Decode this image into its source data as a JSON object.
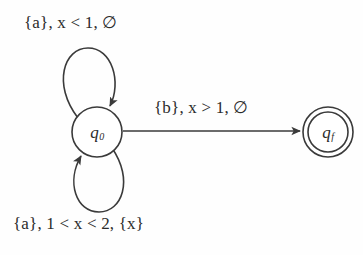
{
  "figure": {
    "kind": "timed-automaton-diagram",
    "background_color": "#fefefe",
    "stroke_color": "#3a3a3a",
    "text_color": "#2b2b2b"
  },
  "states": {
    "initial": {
      "id": "q0",
      "name": "q",
      "subscript": "0",
      "accepting": false,
      "center": {
        "x": 97,
        "y": 132
      },
      "radius": 25
    },
    "final": {
      "id": "qf",
      "name": "q",
      "subscript": "f",
      "accepting": true,
      "center": {
        "x": 328,
        "y": 132
      },
      "outer_radius": 25,
      "inner_radius": 20
    }
  },
  "transitions": {
    "self_loop_top": {
      "label": "{a}, x < 1, ∅",
      "action": "{a}",
      "guard": "x < 1",
      "reset": "∅",
      "from": "q0",
      "to": "q0"
    },
    "edge_to_final": {
      "label": "{b}, x > 1, ∅",
      "action": "{b}",
      "guard": "x > 1",
      "reset": "∅",
      "from": "q0",
      "to": "qf"
    },
    "self_loop_bottom": {
      "label": "{a}, 1 < x < 2, {x}",
      "action": "{a}",
      "guard": "1 < x < 2",
      "reset": "{x}",
      "from": "q0",
      "to": "q0"
    }
  }
}
